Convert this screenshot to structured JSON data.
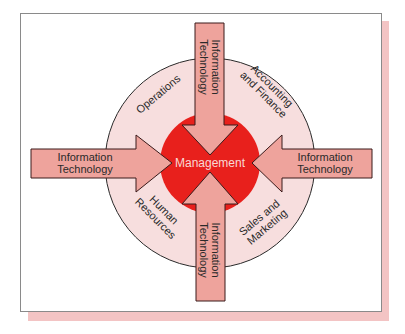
{
  "colors": {
    "frame_border": "#8a8a8a",
    "shadow": "#f3c4c4",
    "outer_ring": "#f7dede",
    "outer_ring_stroke": "#2a2a2a",
    "core": "#e8201c",
    "arrow_fill": "#eea39c",
    "arrow_stroke": "#3a1a1a",
    "label_text": "#2a2a2a",
    "core_text": "#f8d8d4"
  },
  "diagram": {
    "center_label": "Management",
    "segments": [
      {
        "id": "operations",
        "lines": [
          "Operations"
        ]
      },
      {
        "id": "accounting-finance",
        "lines": [
          "Accounting",
          "and Finance"
        ]
      },
      {
        "id": "human-resources",
        "lines": [
          "Human",
          "Resources"
        ]
      },
      {
        "id": "sales-marketing",
        "lines": [
          "Sales and",
          "Marketing"
        ]
      }
    ],
    "arrows": [
      {
        "id": "top",
        "direction": "down",
        "lines": [
          "Information",
          "Technology"
        ]
      },
      {
        "id": "left",
        "direction": "right",
        "lines": [
          "Information",
          "Technology"
        ]
      },
      {
        "id": "right",
        "direction": "left",
        "lines": [
          "Information",
          "Technology"
        ]
      },
      {
        "id": "bottom",
        "direction": "up",
        "lines": [
          "Information",
          "Technology"
        ]
      }
    ]
  }
}
